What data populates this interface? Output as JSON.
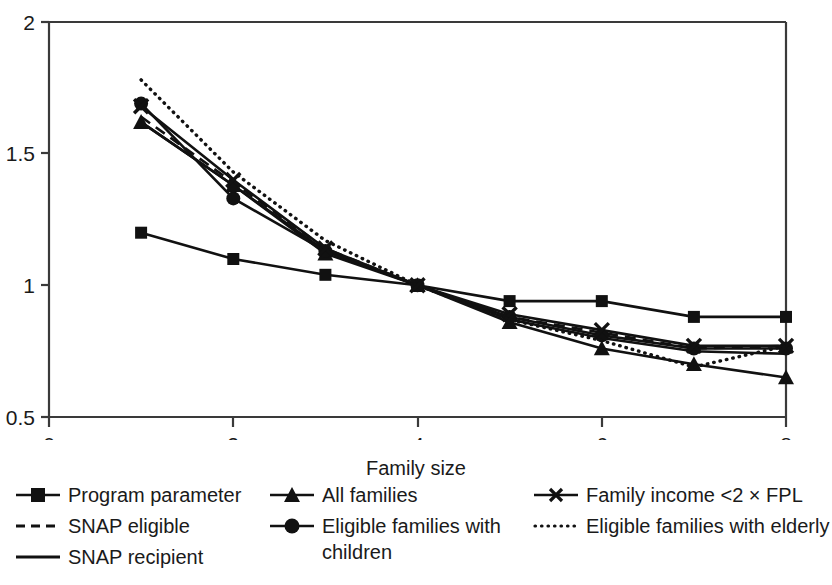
{
  "chart_data": {
    "type": "line",
    "title": "",
    "xlabel": "Family size",
    "ylabel": "",
    "xlim": [
      0,
      8
    ],
    "ylim": [
      0.5,
      2
    ],
    "xticks": [
      "0",
      "2",
      "4",
      "6",
      "8"
    ],
    "xtick_values": [
      0,
      2,
      4,
      6,
      8
    ],
    "yticks": [
      "0.5",
      "1",
      "1.5",
      "2"
    ],
    "ytick_values": [
      0.5,
      1,
      1.5,
      2
    ],
    "grid": false,
    "legend_position": "below-axes",
    "x": [
      1,
      2,
      3,
      4,
      5,
      6,
      7,
      8
    ],
    "series": [
      {
        "name": "Program parameter",
        "marker": "square",
        "line": "solid",
        "values": [
          1.2,
          1.1,
          1.04,
          1.0,
          0.94,
          0.94,
          0.88,
          0.88
        ]
      },
      {
        "name": "SNAP eligible",
        "marker": "none",
        "line": "dashed",
        "values": [
          1.64,
          1.39,
          1.14,
          1.0,
          0.88,
          0.82,
          0.76,
          0.77
        ]
      },
      {
        "name": "SNAP recipient",
        "marker": "none",
        "line": "solid",
        "values": [
          1.62,
          1.38,
          1.13,
          1.0,
          0.87,
          0.8,
          0.75,
          0.74
        ]
      },
      {
        "name": "All families",
        "marker": "triangle",
        "line": "solid",
        "values": [
          1.62,
          1.38,
          1.12,
          1.0,
          0.86,
          0.76,
          0.7,
          0.65
        ]
      },
      {
        "name": "Eligible families with children",
        "marker": "circle",
        "line": "solid",
        "values": [
          1.69,
          1.33,
          1.13,
          1.0,
          0.88,
          0.81,
          0.76,
          0.76
        ]
      },
      {
        "name": "Family income <2 × FPL",
        "marker": "x",
        "line": "solid",
        "values": [
          1.68,
          1.4,
          1.14,
          1.0,
          0.89,
          0.83,
          0.77,
          0.77
        ]
      },
      {
        "name": "Eligible families with elderly",
        "marker": "none",
        "line": "dotted",
        "values": [
          1.78,
          1.43,
          1.17,
          1.0,
          0.87,
          0.79,
          0.69,
          0.77
        ]
      }
    ]
  },
  "axes": {
    "x_label": "Family size",
    "x_ticks": [
      "0",
      "2",
      "4",
      "6",
      "8"
    ],
    "y_ticks": [
      "0.5",
      "1",
      "1.5",
      "2"
    ]
  },
  "legend": {
    "col1": [
      {
        "label": "Program parameter",
        "key": "line-square-marker"
      },
      {
        "label": "SNAP eligible",
        "key": "line-dashed"
      },
      {
        "label": "SNAP recipient",
        "key": "line-solid"
      }
    ],
    "col2": [
      {
        "label": "All families",
        "key": "line-triangle-marker"
      },
      {
        "label": "Eligible families with children",
        "key": "line-circle-marker"
      }
    ],
    "col3": [
      {
        "label": "Family income <2 × FPL",
        "key": "line-x-marker"
      },
      {
        "label": "Eligible families with elderly",
        "key": "line-dotted"
      }
    ]
  },
  "colors": {
    "ink": "#1a1a1a",
    "axis": "#3a3a3a",
    "background": "#ffffff"
  }
}
